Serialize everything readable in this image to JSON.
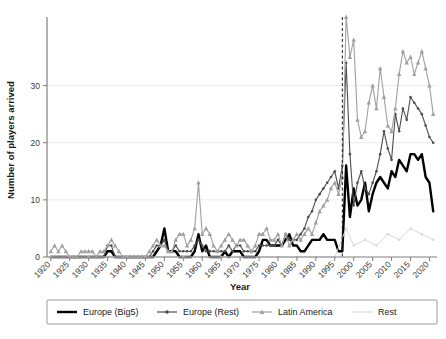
{
  "chart_data": {
    "type": "line",
    "title": "",
    "xlabel": "Year",
    "ylabel": "Number of players arrived",
    "xlim": [
      1919,
      2022
    ],
    "ylim": [
      0,
      42
    ],
    "xticks": [
      1920,
      1925,
      1930,
      1935,
      1940,
      1945,
      1950,
      1955,
      1960,
      1965,
      1970,
      1975,
      1980,
      1985,
      1990,
      1995,
      2000,
      2005,
      2010,
      2015,
      2020
    ],
    "yticks": [
      0,
      10,
      20,
      30
    ],
    "grid": "horizontal",
    "legend_position": "bottom",
    "annotations": [
      {
        "type": "vline",
        "x": 1997,
        "style": "dashed",
        "color": "#1a1a1a"
      }
    ],
    "series": [
      {
        "name": "Europe (Big5)",
        "color": "#000000",
        "width": 2.4,
        "marker": "none",
        "x": [
          1920,
          1921,
          1922,
          1923,
          1924,
          1925,
          1926,
          1927,
          1928,
          1929,
          1930,
          1931,
          1932,
          1933,
          1934,
          1935,
          1936,
          1937,
          1938,
          1939,
          1940,
          1941,
          1942,
          1943,
          1944,
          1945,
          1946,
          1947,
          1948,
          1949,
          1950,
          1951,
          1952,
          1953,
          1954,
          1955,
          1956,
          1957,
          1958,
          1959,
          1960,
          1961,
          1962,
          1963,
          1964,
          1965,
          1966,
          1967,
          1968,
          1969,
          1970,
          1971,
          1972,
          1973,
          1974,
          1975,
          1976,
          1977,
          1978,
          1979,
          1980,
          1981,
          1982,
          1983,
          1984,
          1985,
          1986,
          1987,
          1988,
          1989,
          1990,
          1991,
          1992,
          1993,
          1994,
          1995,
          1996,
          1997,
          1998,
          1999,
          2000,
          2001,
          2002,
          2003,
          2004,
          2005,
          2006,
          2007,
          2008,
          2009,
          2010,
          2011,
          2012,
          2013,
          2014,
          2015,
          2016,
          2017,
          2018,
          2019,
          2020,
          2021
        ],
        "y": [
          0,
          0,
          0,
          0,
          0,
          0,
          0,
          0,
          0,
          0,
          0,
          0,
          0,
          0,
          0,
          1,
          1,
          0,
          0,
          0,
          0,
          0,
          0,
          0,
          0,
          0,
          0,
          0,
          1,
          2,
          5,
          1,
          1,
          1,
          0,
          0,
          0,
          0,
          1,
          4,
          1,
          2,
          0,
          0,
          0,
          0,
          1,
          0,
          1,
          1,
          1,
          0,
          0,
          0,
          0,
          1,
          3,
          3,
          2,
          2,
          2,
          2,
          3,
          4,
          2,
          2,
          1,
          1,
          2,
          3,
          3,
          3,
          4,
          3,
          3,
          3,
          1,
          1,
          16,
          7,
          12,
          9,
          10,
          13,
          8,
          11,
          13,
          14,
          13,
          12,
          15,
          14,
          17,
          16,
          15,
          18,
          18,
          17,
          18,
          14,
          13,
          8
        ]
      },
      {
        "name": "Europe (Rest)",
        "color": "#4d4d4d",
        "width": 1.1,
        "marker": "dot",
        "x": [
          1920,
          1921,
          1922,
          1923,
          1924,
          1925,
          1926,
          1927,
          1928,
          1929,
          1930,
          1931,
          1932,
          1933,
          1934,
          1935,
          1936,
          1937,
          1938,
          1939,
          1940,
          1941,
          1942,
          1943,
          1944,
          1945,
          1946,
          1947,
          1948,
          1949,
          1950,
          1951,
          1952,
          1953,
          1954,
          1955,
          1956,
          1957,
          1958,
          1959,
          1960,
          1961,
          1962,
          1963,
          1964,
          1965,
          1966,
          1967,
          1968,
          1969,
          1970,
          1971,
          1972,
          1973,
          1974,
          1975,
          1976,
          1977,
          1978,
          1979,
          1980,
          1981,
          1982,
          1983,
          1984,
          1985,
          1986,
          1987,
          1988,
          1989,
          1990,
          1991,
          1992,
          1993,
          1994,
          1995,
          1996,
          1997,
          1998,
          1999,
          2000,
          2001,
          2002,
          2003,
          2004,
          2005,
          2006,
          2007,
          2008,
          2009,
          2010,
          2011,
          2012,
          2013,
          2014,
          2015,
          2016,
          2017,
          2018,
          2019,
          2020,
          2021
        ],
        "y": [
          0,
          0,
          0,
          0,
          0,
          0,
          0,
          0,
          0,
          0,
          0,
          0,
          0,
          0,
          0,
          2,
          2,
          0,
          0,
          0,
          0,
          0,
          0,
          0,
          0,
          0,
          0,
          1,
          2,
          2,
          3,
          1,
          1,
          2,
          1,
          1,
          1,
          1,
          2,
          3,
          2,
          1,
          1,
          1,
          1,
          1,
          1,
          2,
          1,
          2,
          2,
          1,
          1,
          1,
          1,
          2,
          2,
          2,
          2,
          2,
          3,
          2,
          4,
          3,
          3,
          3,
          4,
          5,
          7,
          8,
          10,
          11,
          12,
          13,
          14,
          15,
          12,
          16,
          34,
          18,
          9,
          13,
          15,
          12,
          11,
          13,
          15,
          18,
          22,
          19,
          17,
          25,
          22,
          26,
          24,
          28,
          27,
          26,
          25,
          23,
          21,
          20
        ]
      },
      {
        "name": "Latin America",
        "color": "#a0a0a0",
        "width": 1.1,
        "marker": "triangle",
        "x": [
          1920,
          1921,
          1922,
          1923,
          1924,
          1925,
          1926,
          1927,
          1928,
          1929,
          1930,
          1931,
          1932,
          1933,
          1934,
          1935,
          1936,
          1937,
          1938,
          1939,
          1940,
          1941,
          1942,
          1943,
          1944,
          1945,
          1946,
          1947,
          1948,
          1949,
          1950,
          1951,
          1952,
          1953,
          1954,
          1955,
          1956,
          1957,
          1958,
          1959,
          1960,
          1961,
          1962,
          1963,
          1964,
          1965,
          1966,
          1967,
          1968,
          1969,
          1970,
          1971,
          1972,
          1973,
          1974,
          1975,
          1976,
          1977,
          1978,
          1979,
          1980,
          1981,
          1982,
          1983,
          1984,
          1985,
          1986,
          1987,
          1988,
          1989,
          1990,
          1991,
          1992,
          1993,
          1994,
          1995,
          1996,
          1997,
          1998,
          1999,
          2000,
          2001,
          2002,
          2003,
          2004,
          2005,
          2006,
          2007,
          2008,
          2009,
          2010,
          2011,
          2012,
          2013,
          2014,
          2015,
          2016,
          2017,
          2018,
          2019,
          2020,
          2021
        ],
        "y": [
          1,
          2,
          1,
          2,
          1,
          0,
          0,
          0,
          1,
          1,
          1,
          1,
          0,
          1,
          1,
          2,
          3,
          2,
          1,
          0,
          0,
          0,
          0,
          0,
          0,
          0,
          1,
          2,
          3,
          2,
          2,
          1,
          1,
          3,
          4,
          4,
          2,
          3,
          5,
          13,
          4,
          5,
          4,
          2,
          1,
          2,
          3,
          4,
          3,
          2,
          3,
          3,
          2,
          1,
          2,
          4,
          4,
          5,
          3,
          3,
          4,
          2,
          4,
          2,
          3,
          4,
          3,
          4,
          5,
          4,
          6,
          8,
          9,
          10,
          12,
          13,
          11,
          14,
          42,
          35,
          38,
          24,
          21,
          22,
          27,
          30,
          26,
          33,
          28,
          23,
          22,
          26,
          32,
          36,
          34,
          35,
          32,
          34,
          36,
          33,
          30,
          25
        ]
      },
      {
        "name": "Rest",
        "color": "#dadada",
        "width": 1.0,
        "marker": "dot",
        "x": [
          1920,
          1925,
          1930,
          1935,
          1940,
          1945,
          1950,
          1955,
          1960,
          1965,
          1970,
          1975,
          1980,
          1985,
          1990,
          1995,
          1998,
          2000,
          2003,
          2006,
          2009,
          2012,
          2015,
          2018,
          2021
        ],
        "y": [
          0,
          0,
          0,
          0,
          0,
          0,
          0,
          0,
          0,
          0,
          0,
          0,
          0,
          0,
          0,
          0,
          5,
          2,
          3,
          2,
          4,
          3,
          5,
          4,
          3
        ]
      }
    ]
  },
  "legend": {
    "items": [
      {
        "label": "Europe (Big5)"
      },
      {
        "label": "Europe (Rest)"
      },
      {
        "label": "Latin America"
      },
      {
        "label": "Rest"
      }
    ]
  }
}
